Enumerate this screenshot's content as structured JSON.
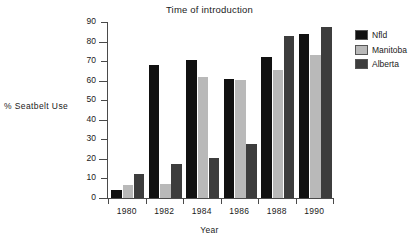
{
  "chart_data": {
    "type": "bar",
    "title": "Time of introduction",
    "xlabel": "Year",
    "ylabel": "% Seatbelt  Use",
    "categories": [
      "1980",
      "1982",
      "1984",
      "1986",
      "1988",
      "1990"
    ],
    "ylim": [
      0,
      90
    ],
    "yticks": [
      0,
      10,
      20,
      30,
      40,
      50,
      60,
      70,
      80,
      90
    ],
    "grid": false,
    "legend_position": "right",
    "series": [
      {
        "name": "Nfld",
        "color": "#111111",
        "values": [
          4,
          68,
          70.5,
          61,
          72,
          84
        ]
      },
      {
        "name": "Manitoba",
        "color": "#b9b9b9",
        "values": [
          6.5,
          7,
          62,
          60.5,
          65.5,
          73
        ]
      },
      {
        "name": "Alberta",
        "color": "#3d3d3d",
        "values": [
          12.5,
          17.5,
          20.5,
          27.5,
          83,
          87.5
        ]
      }
    ]
  }
}
